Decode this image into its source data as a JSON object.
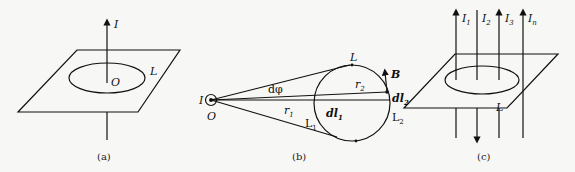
{
  "figure": {
    "panels": [
      {
        "id": "a",
        "caption": "(a)",
        "current_label": "I",
        "center_label": "O",
        "loop_label": "L"
      },
      {
        "id": "b",
        "caption": "(b)",
        "current_label": "I",
        "origin_label": "O",
        "loop_label": "L",
        "angle_label": "dφ",
        "r1_label": "r",
        "r1_sub": "1",
        "r2_label": "r",
        "r2_sub": "2",
        "dl1_label": "dl",
        "dl1_sub": "1",
        "dl2_label": "dl",
        "dl2_sub": "2",
        "L1_label": "L",
        "L1_sub": "1",
        "L2_label": "L",
        "L2_sub": "2",
        "field_label": "B"
      },
      {
        "id": "c",
        "caption": "(c)",
        "loop_label": "L",
        "currents": [
          {
            "label": "I",
            "sub": "1",
            "direction": "up"
          },
          {
            "label": "I",
            "sub": "2",
            "direction": "down"
          },
          {
            "label": "I",
            "sub": "3",
            "direction": "up"
          },
          {
            "label": "I",
            "sub": "n",
            "direction": "up"
          }
        ]
      }
    ]
  }
}
